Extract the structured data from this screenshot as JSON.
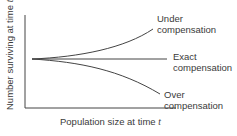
{
  "diagram": {
    "axes": {
      "y_label": "Number surviving at time",
      "y_var": "t",
      "y_sub": "+1",
      "x_label": "Population size at time",
      "x_var": "t"
    },
    "curves": [
      {
        "id": "under",
        "label_line1": "Under",
        "label_line2": "compensation",
        "trend": "curves upward"
      },
      {
        "id": "exact",
        "label_line1": "Exact",
        "label_line2": "compensation",
        "trend": "flat"
      },
      {
        "id": "over",
        "label_line1": "Over",
        "label_line2": "compensation",
        "trend": "curves downward"
      }
    ],
    "colors": {
      "line": "#444444",
      "text": "#3a3a3a"
    }
  }
}
